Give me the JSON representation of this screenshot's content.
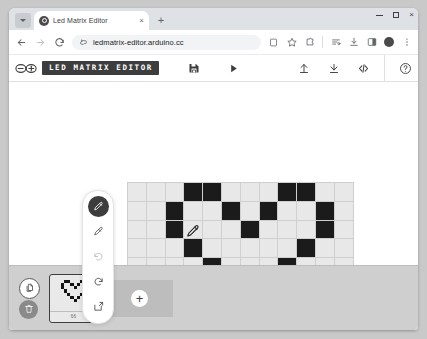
{
  "browser": {
    "tab": {
      "title": "Led Matrix Editor",
      "close_label": "×",
      "favicon": "arduino-favicon"
    },
    "new_tab_label": "+",
    "tab_list_icon": "chevron-down-icon",
    "window_controls": {
      "minimize": "minimize-icon",
      "maximize": "maximize-icon",
      "close": "×"
    },
    "nav": {
      "back": "back-arrow-icon",
      "forward": "forward-arrow-icon",
      "reload": "reload-icon"
    },
    "omnibox": {
      "url": "ledmatrix-editor.arduino.cc",
      "placeholder": "Search Google or type a URL",
      "site_icon": "site-info-icon"
    },
    "toolbar_icons": [
      {
        "name": "save-page-icon"
      },
      {
        "name": "bookmark-star-icon"
      },
      {
        "name": "extensions-puzzle-icon"
      },
      {
        "name": "tab-groups-icon"
      },
      {
        "name": "downloads-icon"
      },
      {
        "name": "side-panel-icon"
      },
      {
        "name": "profile-avatar"
      },
      {
        "name": "chrome-menu-icon"
      }
    ]
  },
  "app": {
    "logo": "arduino-infinity-logo",
    "title": "LED MATRIX EDITOR",
    "center_actions": [
      {
        "name": "save-project-icon",
        "label": "Save"
      },
      {
        "name": "play-icon",
        "label": "Play"
      }
    ],
    "right_actions": [
      {
        "name": "upload-icon",
        "label": "Upload"
      },
      {
        "name": "download-icon",
        "label": "Download"
      },
      {
        "name": "code-icon",
        "label": "</>"
      }
    ],
    "help": {
      "name": "help-icon",
      "label": "?"
    }
  },
  "tools": [
    {
      "name": "pencil-tool",
      "label": "Pencil",
      "active": true,
      "disabled": false
    },
    {
      "name": "eraser-tool",
      "label": "Eraser",
      "active": false,
      "disabled": false
    },
    {
      "name": "undo-tool",
      "label": "Undo",
      "active": false,
      "disabled": true
    },
    {
      "name": "redo-tool",
      "label": "Redo",
      "active": false,
      "disabled": false
    },
    {
      "name": "clear-tool",
      "label": "Clear",
      "active": false,
      "disabled": false
    }
  ],
  "matrix": {
    "columns": 12,
    "rows": 8,
    "on_color": "#1b1b1b",
    "off_color": "#e8e8e8",
    "grid_color": "#cfcfcf",
    "cursor": {
      "name": "pencil-cursor",
      "col": 3,
      "row": 2
    },
    "pixels": [
      [
        0,
        0,
        0,
        1,
        1,
        0,
        0,
        0,
        1,
        1,
        0,
        0
      ],
      [
        0,
        0,
        1,
        0,
        0,
        1,
        0,
        1,
        0,
        0,
        1,
        0
      ],
      [
        0,
        0,
        1,
        0,
        0,
        0,
        1,
        0,
        0,
        0,
        1,
        0
      ],
      [
        0,
        0,
        0,
        1,
        0,
        0,
        0,
        0,
        0,
        1,
        0,
        0
      ],
      [
        0,
        0,
        0,
        0,
        1,
        0,
        0,
        0,
        1,
        0,
        0,
        0
      ],
      [
        0,
        0,
        0,
        0,
        0,
        1,
        0,
        1,
        0,
        0,
        0,
        0
      ],
      [
        0,
        0,
        0,
        0,
        0,
        0,
        1,
        0,
        0,
        0,
        0,
        0
      ],
      [
        0,
        0,
        0,
        0,
        0,
        0,
        0,
        0,
        0,
        0,
        0,
        0
      ]
    ]
  },
  "frames_panel": {
    "duplicate_button": {
      "name": "duplicate-frame-button",
      "label": "Duplicate"
    },
    "delete_button": {
      "name": "delete-frame-button",
      "label": "Delete"
    },
    "add_button": {
      "name": "add-frame-button",
      "label": "+"
    },
    "frames": [
      {
        "index": 1,
        "duration": "66",
        "selected": true
      }
    ]
  }
}
